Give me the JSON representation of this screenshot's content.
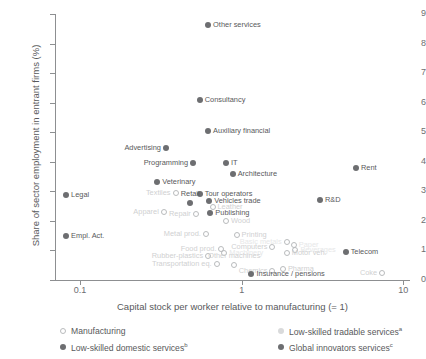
{
  "chart_data": {
    "type": "scatter",
    "title": "",
    "xlabel": "Capital stock per worker relative to manufacturing (= 1)",
    "ylabel": "Share of sector employment in entrant firms (%)",
    "xscale": "log",
    "xlim": [
      0.07,
      11
    ],
    "ylim": [
      0,
      9
    ],
    "xticks": [
      "0.1",
      "1",
      "10"
    ],
    "xtick_values": [
      0.1,
      1,
      10
    ],
    "yticks": [
      "0",
      "1",
      "2",
      "3",
      "4",
      "5",
      "6",
      "7",
      "8",
      "9"
    ],
    "grid": false,
    "legend_position": "bottom",
    "series": [
      {
        "name": "Manufacturing",
        "key": "manufacturing",
        "color": "#b9bbbd",
        "marker": "open-circle"
      },
      {
        "name": "Low-skilled tradable services",
        "key": "lowtrade",
        "color": "#d9dadb",
        "marker": "filled-circle",
        "note": "a"
      },
      {
        "name": "Low-skilled domestic services",
        "key": "lowdom",
        "color": "#6d6e71",
        "marker": "filled-circle",
        "note": "b"
      },
      {
        "name": "Global innovators services",
        "key": "global",
        "color": "#6d6e71",
        "marker": "filled-circle",
        "note": "c"
      }
    ],
    "points": [
      {
        "label": "Other services",
        "x": 0.62,
        "y": 8.62,
        "series": "global",
        "lbl_side": "l",
        "tone": "dark"
      },
      {
        "label": "Consultancy",
        "x": 0.55,
        "y": 6.1,
        "series": "global",
        "lbl_side": "l",
        "tone": "dark"
      },
      {
        "label": "Auxiliary financial",
        "x": 0.62,
        "y": 5.05,
        "series": "global",
        "lbl_side": "l",
        "tone": "dark"
      },
      {
        "label": "Advertising",
        "x": 0.34,
        "y": 4.48,
        "series": "global",
        "lbl_side": "r",
        "tone": "dark"
      },
      {
        "label": "Programming",
        "x": 0.5,
        "y": 3.95,
        "series": "global",
        "lbl_side": "r",
        "tone": "dark"
      },
      {
        "label": "IT",
        "x": 0.8,
        "y": 3.95,
        "series": "global",
        "lbl_side": "l",
        "tone": "dark"
      },
      {
        "label": "Architecture",
        "x": 0.88,
        "y": 3.6,
        "series": "global",
        "lbl_side": "l",
        "tone": "dark"
      },
      {
        "label": "Rent",
        "x": 5.1,
        "y": 3.8,
        "series": "global",
        "lbl_side": "l",
        "tone": "dark"
      },
      {
        "label": "Veterinary",
        "x": 0.3,
        "y": 3.3,
        "series": "lowdom",
        "lbl_side": "l",
        "tone": "dark"
      },
      {
        "label": "Legal",
        "x": 0.082,
        "y": 2.88,
        "series": "global",
        "lbl_side": "l",
        "tone": "dark"
      },
      {
        "label": "Textiles",
        "x": 0.39,
        "y": 2.95,
        "series": "manufacturing",
        "lbl_side": "r",
        "tone": "faint"
      },
      {
        "label": "Tour operators",
        "x": 0.55,
        "y": 2.92,
        "series": "lowdom",
        "lbl_side": "l",
        "tone": "dark"
      },
      {
        "label": "Vehicles trade",
        "x": 0.63,
        "y": 2.66,
        "series": "lowdom",
        "lbl_side": "l",
        "tone": "dark"
      },
      {
        "label": "Retail",
        "x": 0.48,
        "y": 2.62,
        "series": "lowdom",
        "lbl_side": "c",
        "tone": "dark"
      },
      {
        "label": "Leather",
        "x": 0.66,
        "y": 2.46,
        "series": "manufacturing",
        "lbl_side": "l",
        "tone": "faint"
      },
      {
        "label": "R&D",
        "x": 3.05,
        "y": 2.72,
        "series": "global",
        "lbl_side": "l",
        "tone": "dark"
      },
      {
        "label": "Apparel",
        "x": 0.33,
        "y": 2.3,
        "series": "manufacturing",
        "lbl_side": "r",
        "tone": "faint"
      },
      {
        "label": "Repair",
        "x": 0.52,
        "y": 2.25,
        "series": "manufacturing",
        "lbl_side": "r",
        "tone": "faint"
      },
      {
        "label": "Publishing",
        "x": 0.64,
        "y": 2.28,
        "series": "lowdom",
        "lbl_side": "l",
        "tone": "dark"
      },
      {
        "label": "Wood",
        "x": 0.8,
        "y": 2.0,
        "series": "manufacturing",
        "lbl_side": "l",
        "tone": "faint"
      },
      {
        "label": "Empl. Act.",
        "x": 0.082,
        "y": 1.5,
        "series": "global",
        "lbl_side": "l",
        "tone": "dark"
      },
      {
        "label": "Metal prod.",
        "x": 0.6,
        "y": 1.55,
        "series": "manufacturing",
        "lbl_side": "r",
        "tone": "faint"
      },
      {
        "label": "Printing",
        "x": 0.93,
        "y": 1.52,
        "series": "manufacturing",
        "lbl_side": "l",
        "tone": "faint"
      },
      {
        "label": "Basic metals",
        "x": 1.9,
        "y": 1.3,
        "series": "manufacturing",
        "lbl_side": "r",
        "tone": "vfaint"
      },
      {
        "label": "Paper",
        "x": 2.1,
        "y": 1.2,
        "series": "manufacturing",
        "lbl_side": "l",
        "tone": "vfaint"
      },
      {
        "label": "Computers",
        "x": 1.55,
        "y": 1.12,
        "series": "manufacturing",
        "lbl_side": "r",
        "tone": "faint"
      },
      {
        "label": "Beverages",
        "x": 2.15,
        "y": 1.02,
        "series": "manufacturing",
        "lbl_side": "l",
        "tone": "vfaint"
      },
      {
        "label": "Motor veh.",
        "x": 1.9,
        "y": 0.92,
        "series": "manufacturing",
        "lbl_side": "l",
        "tone": "faint"
      },
      {
        "label": "Food prod.",
        "x": 0.75,
        "y": 1.05,
        "series": "manufacturing",
        "lbl_side": "r",
        "tone": "faint"
      },
      {
        "label": "Machinery",
        "x": 0.78,
        "y": 0.92,
        "series": "manufacturing",
        "lbl_side": "l",
        "tone": "vfaint"
      },
      {
        "label": "Rubber-plastics",
        "x": 0.62,
        "y": 0.8,
        "series": "manufacturing",
        "lbl_side": "r",
        "tone": "faint"
      },
      {
        "label": "Transportation eq.",
        "x": 0.7,
        "y": 0.55,
        "series": "manufacturing",
        "lbl_side": "r",
        "tone": "faint"
      },
      {
        "label": "Other machines",
        "x": 0.9,
        "y": 0.5,
        "series": "manufacturing",
        "lbl_side": "c",
        "tone": "faint"
      },
      {
        "label": "Telecom",
        "x": 4.4,
        "y": 0.95,
        "series": "global",
        "lbl_side": "l",
        "tone": "dark"
      },
      {
        "label": "Chemics",
        "x": 1.55,
        "y": 0.3,
        "series": "manufacturing",
        "lbl_side": "r",
        "tone": "faint"
      },
      {
        "label": "Pharma",
        "x": 1.8,
        "y": 0.38,
        "series": "manufacturing",
        "lbl_side": "l",
        "tone": "faint"
      },
      {
        "label": "Insurance / pensions",
        "x": 1.15,
        "y": 0.2,
        "series": "global",
        "lbl_side": "l",
        "tone": "dark"
      },
      {
        "label": "Coke",
        "x": 7.4,
        "y": 0.22,
        "series": "manufacturing",
        "lbl_side": "r",
        "tone": "faint"
      }
    ]
  },
  "axes": {
    "y_title": "Share of sector employment in entrant firms (%)",
    "x_title": "Capital stock per worker relative to manufacturing (= 1)"
  },
  "legend": {
    "items": [
      {
        "label": "Manufacturing",
        "note": "",
        "key": "manufacturing"
      },
      {
        "label": "Low-skilled tradable services",
        "note": "a",
        "key": "lowtrade"
      },
      {
        "label": "Low-skilled domestic services",
        "note": "b",
        "key": "lowdom"
      },
      {
        "label": "Global innovators services",
        "note": "c",
        "key": "global"
      }
    ]
  }
}
